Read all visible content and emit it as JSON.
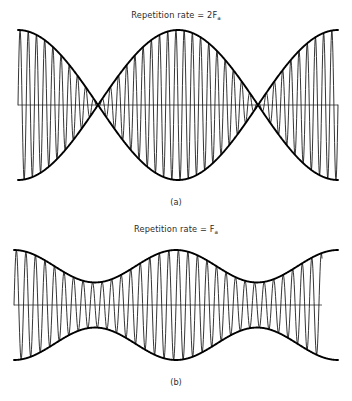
{
  "figure": {
    "background_color": "#ffffff",
    "ink_color": "#111111",
    "axis_color": "#4f4f4f",
    "width": 352,
    "height": 401
  },
  "panels": [
    {
      "id": "a",
      "title_prefix": "Repetition rate = 2F",
      "title_subscript": "a",
      "caption": "(a)"
    },
    {
      "id": "b",
      "title_prefix": "Repetition rate = F",
      "title_subscript": "a",
      "caption": "(b)"
    }
  ],
  "chart_data": [
    {
      "type": "line",
      "id": "waveform-a",
      "title": "Repetition rate = 2Fa",
      "description": "Amplitude-modulated carrier at 100 percent modulation; the envelope pinches to zero so the envelope peaks repeat at twice the modulating frequency.",
      "xlabel": "",
      "ylabel": "",
      "grid": false,
      "legend": "none",
      "modulation_percent": 100,
      "envelope_repetition_rate": "2Fa",
      "modulating_cycles": 1,
      "carrier_cycles": 39,
      "pinch_points_x": [
        0,
        0.5,
        1
      ],
      "envelope_lobes": 2,
      "plot_box": {
        "x0": 18,
        "x1": 338,
        "y_center": 105,
        "y_top": 30,
        "y_bottom": 180
      },
      "ylim": [
        -1,
        1
      ],
      "xlim": [
        0,
        1
      ],
      "axis_line": {
        "from_x": 18,
        "to_x": 338,
        "y": 105
      },
      "series": [
        {
          "name": "envelope-upper",
          "formula": "A*abs(cos(2*pi*x))",
          "amplitude": 1.0
        },
        {
          "name": "envelope-lower",
          "formula": "-A*abs(cos(2*pi*x))",
          "amplitude": 1.0
        },
        {
          "name": "carrier",
          "formula": "A*abs(cos(2*pi*x))*sin(2*pi*N*x)",
          "amplitude": 1.0,
          "cycles": 39
        }
      ]
    },
    {
      "type": "line",
      "id": "waveform-b",
      "title": "Repetition rate = Fa",
      "description": "Amplitude-modulated carrier at partial modulation; the envelope never reaches zero so the envelope peaks repeat at the modulating frequency.",
      "xlabel": "",
      "ylabel": "",
      "grid": false,
      "legend": "none",
      "modulation_percent": 42,
      "envelope_repetition_rate": "Fa",
      "modulating_cycles": 2,
      "carrier_cycles": 34,
      "envelope_lobes": 2,
      "envelope_max": 1.0,
      "envelope_min": 0.41,
      "plot_box": {
        "x0": 14,
        "x1": 338,
        "y_center": 305,
        "y_top": 250,
        "y_bottom": 360
      },
      "ylim": [
        -1,
        1
      ],
      "xlim": [
        0,
        1
      ],
      "axis_line": {
        "from_x": 14,
        "to_x": 322,
        "y": 305
      },
      "carrier_extent_x": [
        14,
        322
      ],
      "series": [
        {
          "name": "envelope-upper",
          "formula": "A*(m0 + m1*cos(2*pi*2*x))",
          "dc": 0.705,
          "depth": 0.295
        },
        {
          "name": "envelope-lower",
          "formula": "-A*(m0 + m1*cos(2*pi*2*x))",
          "dc": 0.705,
          "depth": 0.295
        },
        {
          "name": "carrier",
          "formula": "A*(m0 + m1*cos(2*pi*2*x))*sin(2*pi*N*x)",
          "cycles": 34
        }
      ]
    }
  ]
}
